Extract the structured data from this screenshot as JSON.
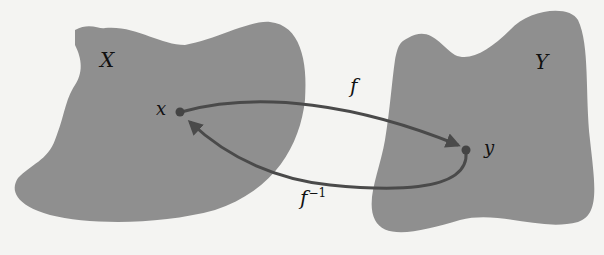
{
  "diagram": {
    "type": "function-inverse-mapping",
    "colors": {
      "background": "#f4f4f2",
      "set_fill": "#8f8f8f",
      "arrow": "#4a4a4a",
      "text": "#111111"
    },
    "sets": [
      {
        "id": "X",
        "label": "X"
      },
      {
        "id": "Y",
        "label": "Y"
      }
    ],
    "points": [
      {
        "id": "x",
        "label": "x",
        "set": "X"
      },
      {
        "id": "y",
        "label": "y",
        "set": "Y"
      }
    ],
    "arrows": [
      {
        "id": "f",
        "label": "f",
        "from": "x",
        "to": "y"
      },
      {
        "id": "f_inv",
        "label_base": "f",
        "label_sup": "−1",
        "from": "y",
        "to": "x"
      }
    ]
  }
}
